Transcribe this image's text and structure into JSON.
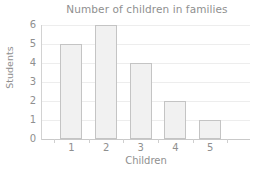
{
  "chart_data": {
    "type": "bar",
    "title": "Number of children in families",
    "xlabel": "Children",
    "ylabel": "Students",
    "categories": [
      "1",
      "2",
      "3",
      "4",
      "5"
    ],
    "values": [
      5,
      6,
      4,
      2,
      1
    ],
    "ylim": [
      0,
      6
    ],
    "yticks": [
      "0",
      "1",
      "2",
      "3",
      "4",
      "5",
      "6"
    ],
    "grid": true,
    "legend": false,
    "colors": {
      "bar_fill": "#f1f1f1",
      "bar_border": "#c4c4c4",
      "gridline": "#ededed",
      "axis": "#c9c9c9",
      "text": "#8f8f8f",
      "background": "#ffffff"
    }
  }
}
